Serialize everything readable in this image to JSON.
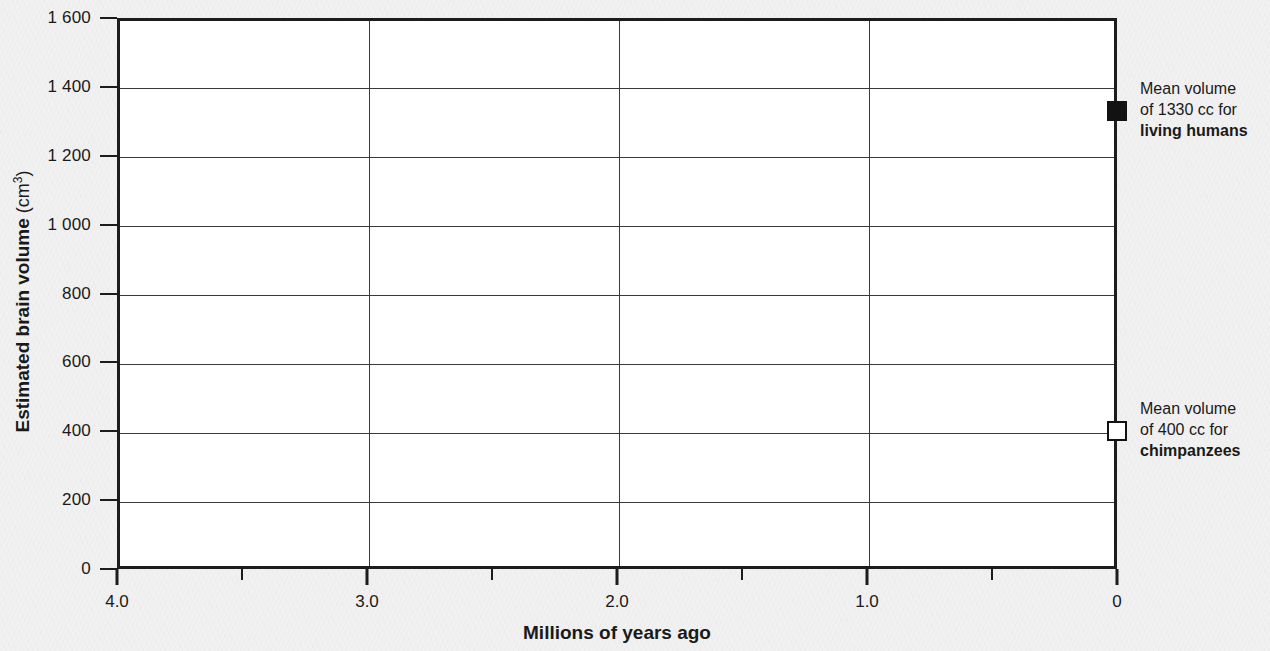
{
  "chart_data": {
    "type": "scatter",
    "title": "",
    "xlabel": "Millions of years ago",
    "ylabel": "Estimated brain volume",
    "ylabel_unit": "(cm3)",
    "ylabel_unit_base": "(cm",
    "ylabel_unit_sup": "3",
    "ylabel_unit_close": ")",
    "xlim": [
      4.0,
      0
    ],
    "ylim": [
      0,
      1600
    ],
    "x_inverted": true,
    "grid": true,
    "legend_position": "right-inline-annotations",
    "y_ticks": [
      {
        "value": 1600,
        "label": "1 600"
      },
      {
        "value": 1400,
        "label": "1 400"
      },
      {
        "value": 1200,
        "label": "1 200"
      },
      {
        "value": 1000,
        "label": "1 000"
      },
      {
        "value": 800,
        "label": "800"
      },
      {
        "value": 600,
        "label": "600"
      },
      {
        "value": 400,
        "label": "400"
      },
      {
        "value": 200,
        "label": "200"
      },
      {
        "value": 0,
        "label": "0"
      }
    ],
    "x_ticks_major": [
      {
        "value": 4.0,
        "label": "4.0"
      },
      {
        "value": 3.0,
        "label": "3.0"
      },
      {
        "value": 2.0,
        "label": "2.0"
      },
      {
        "value": 1.0,
        "label": "1.0"
      },
      {
        "value": 0,
        "label": "0"
      }
    ],
    "x_ticks_minor": [
      3.5,
      2.5,
      1.5,
      0.5
    ],
    "series": [
      {
        "name": "living humans",
        "marker": "filled-square",
        "color": "#121212",
        "points": [
          {
            "x": 0,
            "y": 1330
          }
        ]
      },
      {
        "name": "chimpanzees",
        "marker": "open-square",
        "color": "#ffffff",
        "points": [
          {
            "x": 0,
            "y": 400
          }
        ]
      }
    ],
    "annotations": [
      {
        "id": "humans",
        "x": 0,
        "y": 1330,
        "line1": "Mean volume",
        "line2": "of 1330 cc for",
        "line3": "living humans",
        "marker": "filled-square"
      },
      {
        "id": "chimpanzees",
        "x": 0,
        "y": 400,
        "line1": "Mean volume",
        "line2": "of 400 cc for",
        "line3": "chimpanzees",
        "marker": "open-square"
      }
    ]
  },
  "colors": {
    "background": "#f1f1f1",
    "plot_background": "#ffffff",
    "axis": "#1c1c1c",
    "gridline": "#3a3a3a",
    "marker_filled": "#121212",
    "marker_open": "#ffffff"
  }
}
